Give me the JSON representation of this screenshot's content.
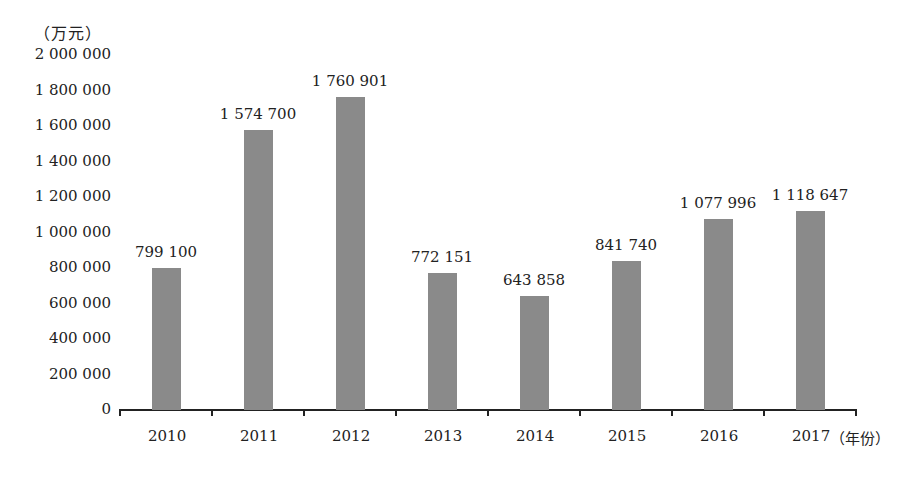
{
  "chart_data": {
    "type": "bar",
    "title": "",
    "xlabel": "(年份)",
    "ylabel": "(万元)",
    "categories": [
      "2010",
      "2011",
      "2012",
      "2013",
      "2014",
      "2015",
      "2016",
      "2017"
    ],
    "values": [
      799100,
      1574700,
      1760901,
      772151,
      643858,
      841740,
      1077996,
      1118647
    ],
    "value_labels": [
      "799 100",
      "1 574 700",
      "1 760 901",
      "772 151",
      "643 858",
      "841 740",
      "1 077 996",
      "1 118 647"
    ],
    "ylim": [
      0,
      2000000
    ],
    "yticks": [
      0,
      200000,
      400000,
      600000,
      800000,
      1000000,
      1200000,
      1400000,
      1600000,
      1800000,
      2000000
    ],
    "ytick_labels": [
      "0",
      "200 000",
      "400 000",
      "600 000",
      "800 000",
      "1 000 000",
      "1 200 000",
      "1 400 000",
      "1 600 000",
      "1 800 000",
      "2 000 000"
    ],
    "grid": false,
    "legend": "none",
    "bar_color": "#8a8a8a"
  },
  "labels": {
    "unit": "（万元）",
    "x_suffix": "（年份）"
  }
}
